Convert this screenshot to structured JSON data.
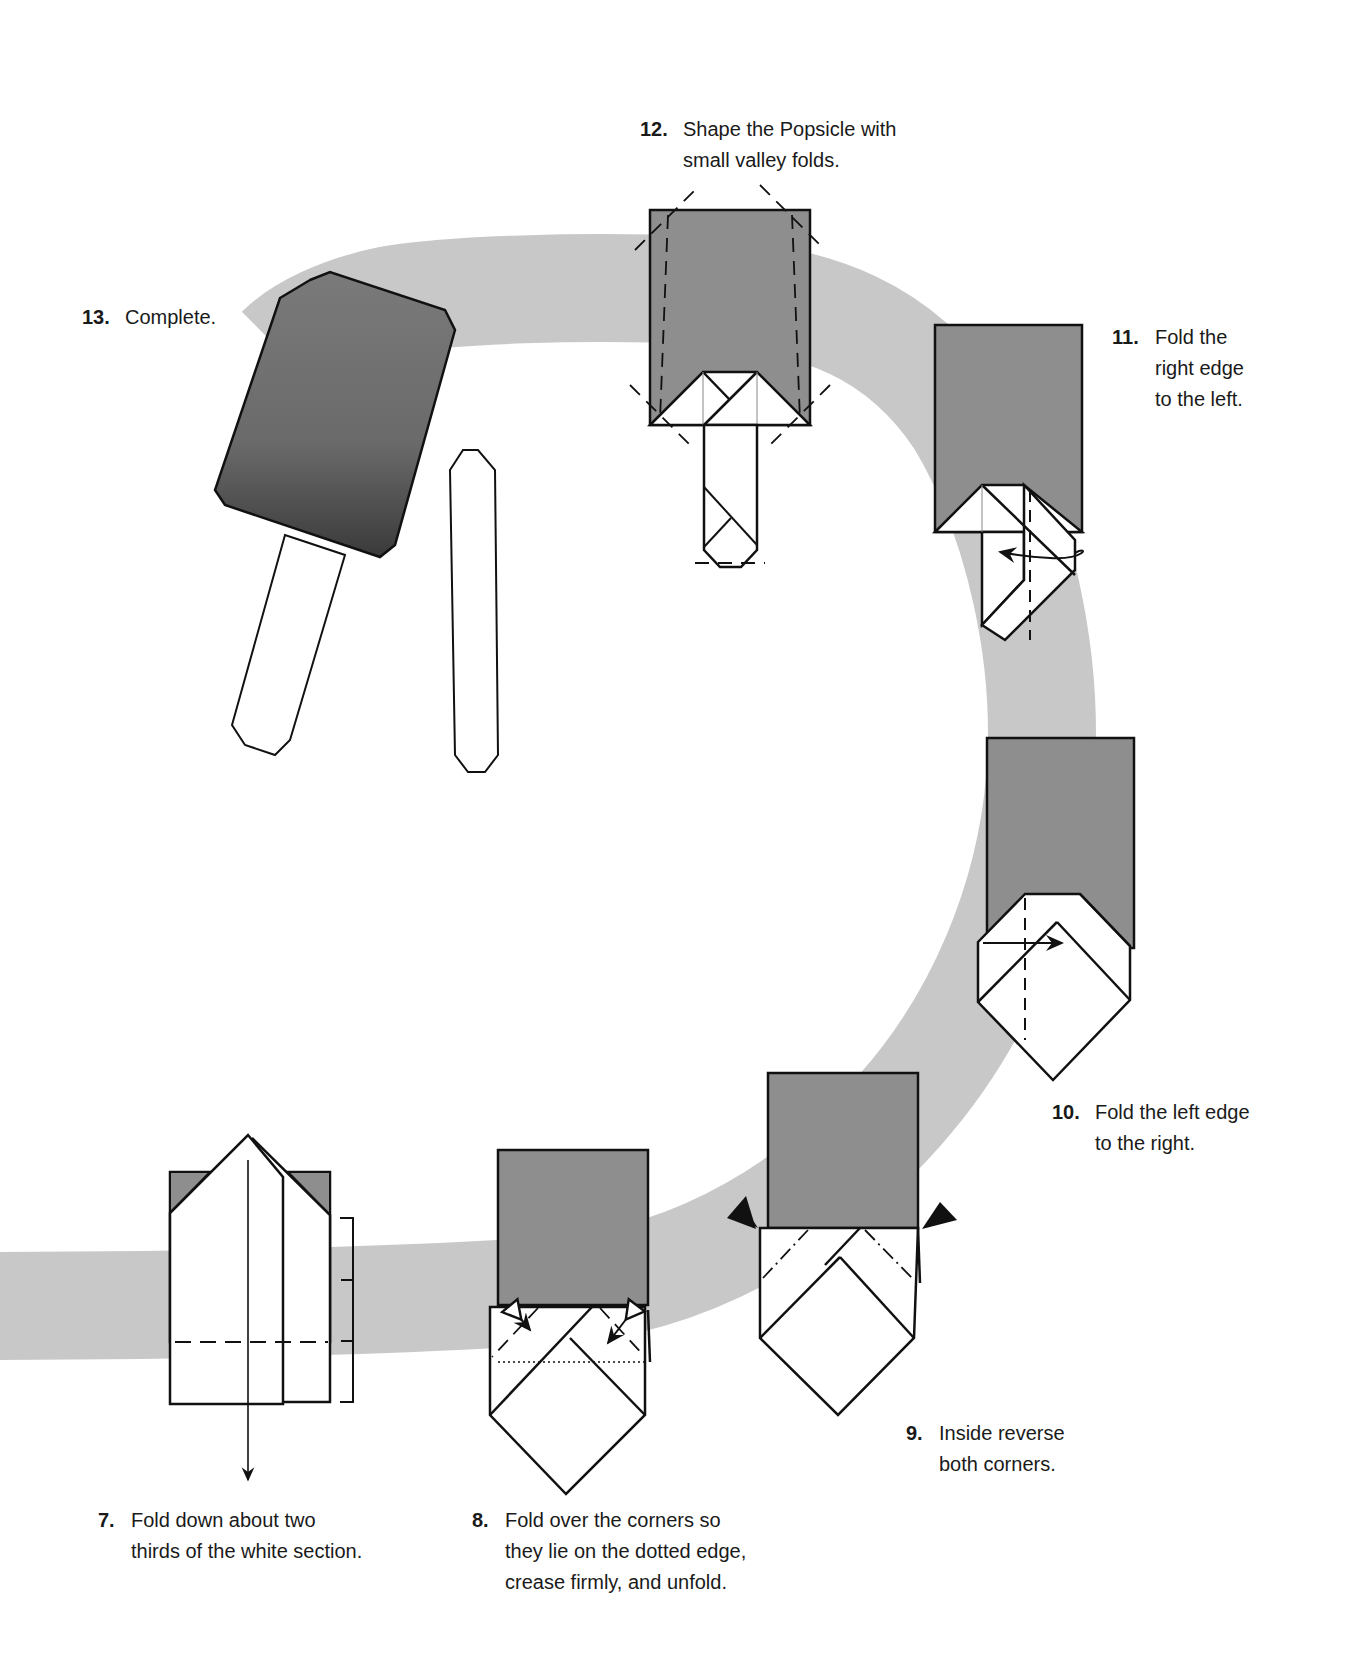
{
  "colors": {
    "background": "#ffffff",
    "path_band": "#c8c8c8",
    "paper_colored": "#8e8e8e",
    "paper_white": "#ffffff",
    "line": "#111111"
  },
  "steps": [
    {
      "number": "7.",
      "text": "Fold down about two\nthirds of the white section."
    },
    {
      "number": "8.",
      "text": "Fold over the corners so\nthey lie on the dotted edge,\ncrease firmly, and unfold."
    },
    {
      "number": "9.",
      "text": "Inside reverse\nboth corners."
    },
    {
      "number": "10.",
      "text": "Fold the left edge\nto the right."
    },
    {
      "number": "11.",
      "text": "Fold the\nright edge\nto the left."
    },
    {
      "number": "12.",
      "text": "Shape the Popsicle with\nsmall valley folds."
    },
    {
      "number": "13.",
      "text": "Complete."
    }
  ],
  "icons": {
    "fold_arrow": "arrow",
    "reverse_fold_marker": "black-triangle",
    "fold_unfold_arrow": "double-headed-arrow"
  }
}
